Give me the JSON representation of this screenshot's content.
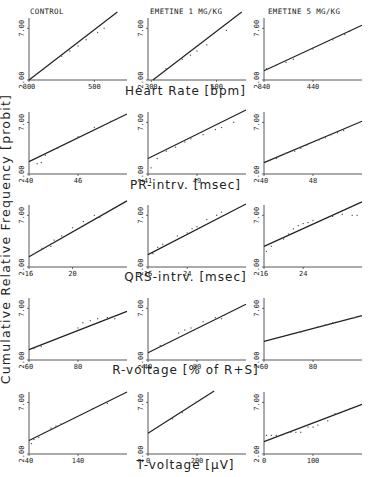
{
  "figure": {
    "y_axis_label": "Cumulative Relative Frequency [probit]",
    "column_titles": [
      "CONTROL",
      "EMETINE 1 MG/KG",
      "EMETINE 5 MG/KG"
    ],
    "row_titles": [
      "Heart Rate [bpm]",
      "PR-intrv. [msec]",
      "QRS-intrv. [msec]",
      "R-voltage [% of R+S]",
      "T-voltage [µV]"
    ]
  },
  "chart_data": [
    {
      "type": "scatter",
      "row": 0,
      "col": 0,
      "group": "CONTROL",
      "xlabel": "Heart Rate [bpm]",
      "ylabel": "Cumulative Relative Frequency [probit]",
      "yticks": [
        "2.00",
        "7.00"
      ],
      "xticks": [
        "300",
        "500"
      ],
      "xlim": [
        300,
        600
      ],
      "ylim": [
        2,
        8
      ],
      "fit_line": {
        "x": [
          300,
          600
        ],
        "y": [
          2.0,
          9.3
        ]
      },
      "points": [
        [
          345,
          3.1
        ],
        [
          400,
          4.3
        ],
        [
          425,
          4.8
        ],
        [
          450,
          5.3
        ],
        [
          475,
          5.9
        ],
        [
          510,
          6.6
        ],
        [
          530,
          7.0
        ]
      ]
    },
    {
      "type": "scatter",
      "row": 0,
      "col": 1,
      "group": "EMETINE 1 MG/KG",
      "xlabel": "Heart Rate [bpm]",
      "ylabel": "Cumulative Relative Frequency [probit]",
      "yticks": [
        "2.00",
        "7.00"
      ],
      "xticks": [
        "300",
        "500"
      ],
      "xlim": [
        290,
        590
      ],
      "ylim": [
        2,
        8
      ],
      "fit_line": {
        "x": [
          305,
          590
        ],
        "y": [
          2.0,
          8.9
        ]
      },
      "points": [
        [
          345,
          3.1
        ],
        [
          395,
          4.0
        ],
        [
          420,
          4.4
        ],
        [
          440,
          4.8
        ],
        [
          470,
          5.4
        ],
        [
          530,
          6.8
        ]
      ]
    },
    {
      "type": "scatter",
      "row": 0,
      "col": 2,
      "group": "EMETINE 5 MG/KG",
      "xlabel": "Heart Rate [bpm]",
      "ylabel": "Cumulative Relative Frequency [probit]",
      "yticks": [
        "2.00",
        "7.00"
      ],
      "xticks": [
        "340",
        "440"
      ],
      "xlim": [
        340,
        540
      ],
      "ylim": [
        2,
        8
      ],
      "fit_line": {
        "x": [
          340,
          540
        ],
        "y": [
          2.9,
          7.3
        ]
      },
      "points": [
        [
          345,
          3.1
        ],
        [
          365,
          3.4
        ],
        [
          385,
          3.7
        ],
        [
          400,
          4.0
        ],
        [
          440,
          5.0
        ],
        [
          480,
          5.9
        ],
        [
          505,
          6.4
        ],
        [
          515,
          6.7
        ]
      ]
    },
    {
      "type": "scatter",
      "row": 1,
      "col": 0,
      "group": "CONTROL",
      "xlabel": "PR-intrv. [msec]",
      "ylabel": "Cumulative Relative Frequency [probit]",
      "yticks": [
        "2.00",
        "7.00"
      ],
      "xticks": [
        "40",
        "46"
      ],
      "xlim": [
        40,
        52
      ],
      "ylim": [
        2,
        8
      ],
      "fit_line": {
        "x": [
          40,
          52
        ],
        "y": [
          3.2,
          7.8
        ]
      },
      "points": [
        [
          41,
          3.0
        ],
        [
          41.5,
          3.1
        ],
        [
          42,
          3.8
        ],
        [
          43.5,
          4.5
        ],
        [
          45,
          5.1
        ],
        [
          46,
          5.6
        ],
        [
          48,
          6.5
        ],
        [
          50,
          7.1
        ]
      ]
    },
    {
      "type": "scatter",
      "row": 1,
      "col": 1,
      "group": "EMETINE 1 MG/KG",
      "xlabel": "PR-intrv. [msec]",
      "ylabel": "Cumulative Relative Frequency [probit]",
      "yticks": [
        "2.00",
        "7.00"
      ],
      "xticks": [
        "41",
        "49"
      ],
      "xlim": [
        41,
        57
      ],
      "ylim": [
        2,
        8
      ],
      "fit_line": {
        "x": [
          41,
          57
        ],
        "y": [
          3.5,
          8.2
        ]
      },
      "points": [
        [
          41.5,
          2.6
        ],
        [
          42.5,
          3.5
        ],
        [
          44,
          4.2
        ],
        [
          45.5,
          4.6
        ],
        [
          47,
          5.1
        ],
        [
          48,
          5.4
        ],
        [
          50,
          5.8
        ],
        [
          52,
          6.3
        ],
        [
          53,
          6.5
        ],
        [
          55,
          7.0
        ]
      ]
    },
    {
      "type": "scatter",
      "row": 1,
      "col": 2,
      "group": "EMETINE 5 MG/KG",
      "xlabel": "PR-intrv. [msec]",
      "ylabel": "Cumulative Relative Frequency [probit]",
      "yticks": [
        "2.00",
        "7.00"
      ],
      "xticks": [
        "40",
        "48"
      ],
      "xlim": [
        40,
        56
      ],
      "ylim": [
        2,
        8
      ],
      "fit_line": {
        "x": [
          40,
          56
        ],
        "y": [
          3.1,
          7.1
        ]
      },
      "points": [
        [
          41,
          3.3
        ],
        [
          42,
          3.5
        ],
        [
          43.5,
          4.0
        ],
        [
          45,
          4.2
        ],
        [
          46,
          4.5
        ],
        [
          47,
          4.8
        ],
        [
          49,
          5.3
        ],
        [
          50,
          5.5
        ],
        [
          51,
          5.8
        ],
        [
          52,
          6.0
        ],
        [
          53,
          6.2
        ]
      ]
    },
    {
      "type": "scatter",
      "row": 2,
      "col": 0,
      "group": "CONTROL",
      "xlabel": "QRS-intrv. [msec]",
      "ylabel": "Cumulative Relative Frequency [probit]",
      "yticks": [
        "2.00",
        "7.00"
      ],
      "xticks": [
        "16",
        "20"
      ],
      "xlim": [
        16,
        25
      ],
      "ylim": [
        2,
        8
      ],
      "fit_line": {
        "x": [
          16,
          25
        ],
        "y": [
          3.0,
          8.4
        ]
      },
      "points": [
        [
          16.5,
          3.3
        ],
        [
          17.2,
          3.8
        ],
        [
          18,
          4.0
        ],
        [
          18.3,
          4.6
        ],
        [
          19,
          5.0
        ],
        [
          20,
          5.8
        ],
        [
          21,
          6.4
        ],
        [
          22,
          7.0
        ],
        [
          22.5,
          6.8
        ]
      ]
    },
    {
      "type": "scatter",
      "row": 2,
      "col": 1,
      "group": "EMETINE 1 MG/KG",
      "xlabel": "QRS-intrv. [msec]",
      "ylabel": "Cumulative Relative Frequency [probit]",
      "yticks": [
        "2.00",
        "7.00"
      ],
      "xticks": [
        "16",
        "24"
      ],
      "xlim": [
        16,
        36
      ],
      "ylim": [
        2,
        8
      ],
      "fit_line": {
        "x": [
          16,
          36
        ],
        "y": [
          3.2,
          8.1
        ]
      },
      "points": [
        [
          17,
          3.3
        ],
        [
          18,
          3.9
        ],
        [
          19,
          4.2
        ],
        [
          22,
          5.0
        ],
        [
          24,
          5.3
        ],
        [
          25,
          5.7
        ],
        [
          26,
          5.9
        ],
        [
          28,
          6.6
        ],
        [
          30,
          7.0
        ],
        [
          31,
          7.3
        ]
      ]
    },
    {
      "type": "scatter",
      "row": 2,
      "col": 2,
      "group": "EMETINE 5 MG/KG",
      "xlabel": "QRS-intrv. [msec]",
      "ylabel": "Cumulative Relative Frequency [probit]",
      "yticks": [
        "2.00",
        "7.00"
      ],
      "xticks": [
        "16",
        "24"
      ],
      "xlim": [
        16,
        36
      ],
      "ylim": [
        2,
        8
      ],
      "fit_line": {
        "x": [
          16,
          36
        ],
        "y": [
          4.0,
          8.3
        ]
      },
      "points": [
        [
          16.5,
          3.5
        ],
        [
          17.5,
          4.0
        ],
        [
          20,
          4.7
        ],
        [
          21,
          5.2
        ],
        [
          22,
          5.7
        ],
        [
          23,
          6.0
        ],
        [
          24,
          6.2
        ],
        [
          25,
          6.3
        ],
        [
          26,
          6.5
        ],
        [
          30,
          6.9
        ],
        [
          32,
          7.1
        ],
        [
          34,
          7.0
        ],
        [
          35,
          7.0
        ]
      ]
    },
    {
      "type": "scatter",
      "row": 3,
      "col": 0,
      "group": "CONTROL",
      "xlabel": "R-voltage [% of R+S]",
      "ylabel": "Cumulative Relative Frequency [probit]",
      "yticks": [
        "2.00",
        "7.00"
      ],
      "xticks": [
        "60",
        "80"
      ],
      "xlim": [
        60,
        100
      ],
      "ylim": [
        2,
        8
      ],
      "fit_line": {
        "x": [
          60,
          100
        ],
        "y": [
          3.0,
          6.7
        ]
      },
      "points": [
        [
          62,
          3.1
        ],
        [
          65,
          3.3
        ],
        [
          72,
          4.1
        ],
        [
          80,
          5.1
        ],
        [
          82,
          5.6
        ],
        [
          85,
          5.8
        ],
        [
          88,
          6.0
        ],
        [
          92,
          6.1
        ],
        [
          95,
          6.0
        ]
      ]
    },
    {
      "type": "scatter",
      "row": 3,
      "col": 1,
      "group": "EMETINE 1 MG/KG",
      "xlabel": "R-voltage [% of R+S]",
      "ylabel": "Cumulative Relative Frequency [probit]",
      "yticks": [
        "2.00",
        "7.00"
      ],
      "xticks": [
        "40",
        "80"
      ],
      "xlim": [
        40,
        120
      ],
      "ylim": [
        2,
        8
      ],
      "fit_line": {
        "x": [
          40,
          120
        ],
        "y": [
          2.7,
          7.4
        ]
      },
      "points": [
        [
          50,
          3.4
        ],
        [
          65,
          4.6
        ],
        [
          70,
          4.9
        ],
        [
          75,
          5.1
        ],
        [
          85,
          5.7
        ],
        [
          95,
          6.1
        ],
        [
          100,
          6.0
        ]
      ]
    },
    {
      "type": "scatter",
      "row": 3,
      "col": 2,
      "group": "EMETINE 5 MG/KG",
      "xlabel": "R-voltage [% of R+S]",
      "ylabel": "Cumulative Relative Frequency [probit]",
      "yticks": [
        "2.00",
        "7.00"
      ],
      "xticks": [
        "60",
        "80"
      ],
      "xlim": [
        60,
        100
      ],
      "ylim": [
        2,
        8
      ],
      "fit_line": {
        "x": [
          60,
          100
        ],
        "y": [
          3.8,
          6.3
        ]
      },
      "points": [
        [
          75,
          4.7
        ],
        [
          82,
          5.2
        ],
        [
          85,
          5.4
        ],
        [
          88,
          5.6
        ],
        [
          97,
          6.1
        ]
      ]
    },
    {
      "type": "scatter",
      "row": 4,
      "col": 0,
      "group": "CONTROL",
      "xlabel": "T-voltage [µV]",
      "ylabel": "Cumulative Relative Frequency [probit]",
      "yticks": [
        "2.00",
        "7.00"
      ],
      "xticks": [
        "40",
        "140"
      ],
      "xlim": [
        40,
        240
      ],
      "ylim": [
        2,
        8
      ],
      "fit_line": {
        "x": [
          40,
          240
        ],
        "y": [
          3.3,
          8.0
        ]
      },
      "points": [
        [
          45,
          3.0
        ],
        [
          50,
          3.4
        ],
        [
          60,
          3.6
        ],
        [
          70,
          4.0
        ],
        [
          85,
          4.5
        ],
        [
          95,
          4.7
        ],
        [
          105,
          4.9
        ],
        [
          170,
          6.4
        ],
        [
          185,
          6.7
        ],
        [
          200,
          6.9
        ]
      ]
    },
    {
      "type": "scatter",
      "row": 4,
      "col": 1,
      "group": "EMETINE 1 MG/KG",
      "xlabel": "T-voltage [µV]",
      "ylabel": "Cumulative Relative Frequency [probit]",
      "yticks": [
        "2.00",
        "7.00"
      ],
      "xticks": [
        "0",
        "200"
      ],
      "xlim": [
        0,
        400
      ],
      "ylim": [
        2,
        8
      ],
      "fit_line": {
        "x": [
          0,
          270
        ],
        "y": [
          4.0,
          8.1
        ]
      },
      "points": [
        [
          100,
          5.4
        ],
        [
          140,
          6.0
        ],
        [
          195,
          7.0
        ]
      ]
    },
    {
      "type": "scatter",
      "row": 4,
      "col": 2,
      "group": "EMETINE 5 MG/KG",
      "xlabel": "T-voltage [µV]",
      "ylabel": "Cumulative Relative Frequency [probit]",
      "yticks": [
        "2.00",
        "7.00"
      ],
      "xticks": [
        "0",
        "100"
      ],
      "xlim": [
        0,
        200
      ],
      "ylim": [
        2,
        8
      ],
      "fit_line": {
        "x": [
          0,
          200
        ],
        "y": [
          3.2,
          6.8
        ]
      },
      "points": [
        [
          5,
          3.8
        ],
        [
          15,
          3.8
        ],
        [
          25,
          3.8
        ],
        [
          45,
          4.0
        ],
        [
          55,
          4.1
        ],
        [
          65,
          4.1
        ],
        [
          75,
          4.1
        ],
        [
          90,
          4.6
        ],
        [
          100,
          4.6
        ],
        [
          110,
          4.8
        ],
        [
          130,
          5.2
        ],
        [
          145,
          5.9
        ],
        [
          160,
          6.1
        ],
        [
          175,
          6.4
        ]
      ]
    }
  ]
}
